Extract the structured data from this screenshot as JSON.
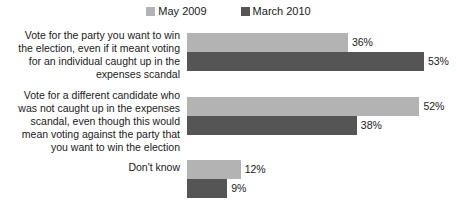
{
  "chart_data": {
    "type": "bar",
    "orientation": "horizontal",
    "title": "",
    "subtitle": "",
    "xlabel": "",
    "ylabel": "",
    "grid": false,
    "legend_position": "top-center",
    "axis_visible": false,
    "value_suffix": "%",
    "xlim": [
      0,
      60
    ],
    "categories": [
      "Vote for the party you want to win the election, even if it meant voting for an individual caught up in the expenses scandal",
      "Vote for a different candidate who was not caught up in the expenses scandal, even though this would mean voting against the party that you want to win the election",
      "Don't know"
    ],
    "series": [
      {
        "name": "May 2009",
        "color": "#b3b3b3",
        "values": [
          36,
          52,
          12
        ],
        "labels": [
          "36%",
          "52%",
          "12%"
        ]
      },
      {
        "name": "March 2010",
        "color": "#555555",
        "values": [
          53,
          38,
          9
        ],
        "labels": [
          "53%",
          "38%",
          "9%"
        ]
      }
    ]
  },
  "legend": {
    "entries": [
      {
        "label": "May 2009",
        "swatch_name": "legend-swatch-may-2009"
      },
      {
        "label": "March 2010",
        "swatch_name": "legend-swatch-march-2010"
      }
    ]
  }
}
